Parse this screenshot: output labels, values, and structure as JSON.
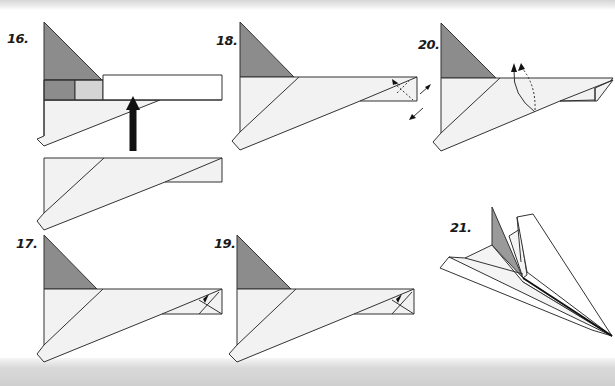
{
  "colors": {
    "paper": "#f2f2f2",
    "paper_white": "#ffffff",
    "fold_dark": "#8c8c8c",
    "fold_mid": "#aaaaaa",
    "fold_light": "#d4d4d4",
    "line": "#333333",
    "arrow": "#111111"
  },
  "steps": [
    {
      "id": "16",
      "label": "16.",
      "x": 7,
      "y": 31
    },
    {
      "id": "18",
      "label": "18.",
      "x": 216,
      "y": 33
    },
    {
      "id": "20",
      "label": "20.",
      "x": 418,
      "y": 37
    },
    {
      "id": "17",
      "label": "17.",
      "x": 16,
      "y": 236
    },
    {
      "id": "19",
      "label": "19.",
      "x": 214,
      "y": 236
    },
    {
      "id": "21",
      "label": "21.",
      "x": 450,
      "y": 220
    }
  ]
}
